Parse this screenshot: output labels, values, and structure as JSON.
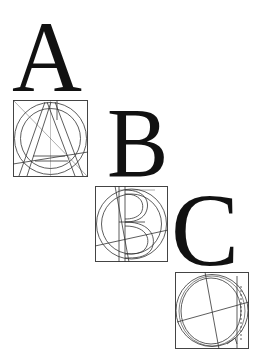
{
  "letters": [
    {
      "char": "A",
      "label": "letter-a"
    },
    {
      "char": "B",
      "label": "letter-b"
    },
    {
      "char": "C",
      "label": "letter-c"
    }
  ],
  "constructions": [
    {
      "letter": "A",
      "desc": "geometric construction of A in square with circles"
    },
    {
      "letter": "B",
      "desc": "geometric construction of B in square with circles"
    },
    {
      "letter": "C",
      "desc": "geometric construction of C in square with circles"
    }
  ],
  "colors": {
    "ink": "#111111",
    "lines": "#333333",
    "background": "#ffffff"
  }
}
